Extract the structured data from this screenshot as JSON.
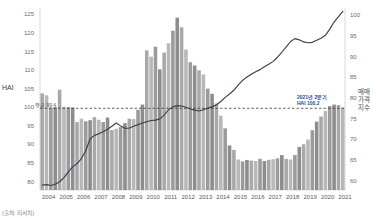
{
  "chart_data": {
    "type": "bar",
    "title": "",
    "subtitle": "",
    "xlabel": "",
    "ylabel": "HAI",
    "ylabel_right": "매매\n가격\n지수",
    "ylim": [
      78,
      127
    ],
    "ylim_right": [
      58,
      102
    ],
    "grid": false,
    "legend_position": "none",
    "reference_line": {
      "value": 100,
      "style": "dashed",
      "label": "평균 99.4"
    },
    "annotations": [
      {
        "text_line1": "평균 99.4",
        "at_x": "2004",
        "at_y": 100
      },
      {
        "text_line1": "2021년 2분기",
        "text_line2": "HAI 100.2",
        "at_x": "2021",
        "at_y": 100.2
      }
    ],
    "categories": [
      "2004",
      "2005",
      "2006",
      "2007",
      "2008",
      "2009",
      "2010",
      "2011",
      "2012",
      "2013",
      "2014",
      "2015",
      "2016",
      "2017",
      "2018",
      "2019",
      "2020",
      "2021"
    ],
    "x_tick_labels": [
      "2004",
      "2005",
      "2006",
      "2007",
      "2008",
      "2009",
      "2010",
      "2011",
      "2012",
      "2013",
      "2014",
      "2015",
      "2016",
      "2017",
      "2018",
      "2019",
      "2020",
      "2021"
    ],
    "y_tick_labels": [
      "125",
      "120",
      "115",
      "110",
      "105",
      "100",
      "95",
      "90",
      "85",
      "80"
    ],
    "y_tick_values": [
      125,
      120,
      115,
      110,
      105,
      100,
      95,
      90,
      85,
      80
    ],
    "y_tick_labels_right": [
      "100",
      "95",
      "90",
      "85",
      "80",
      "75",
      "70",
      "65",
      "60"
    ],
    "y_tick_values_right": [
      100,
      95,
      90,
      85,
      80,
      75,
      70,
      65,
      60
    ],
    "series": [
      {
        "name": "HAI",
        "type": "bar",
        "axis": "left",
        "color": "#9a9a9a",
        "quarterly_values": [
          104.0,
          103.5,
          100.2,
          100.3,
          105.0,
          100.4,
          100.3,
          100.2,
          96.3,
          97.2,
          96.5,
          96.8,
          97.6,
          96.9,
          96.3,
          97.5,
          94.1,
          94.5,
          94.9,
          96.0,
          97.2,
          97.1,
          99.6,
          101.0,
          115.6,
          113.9,
          116.6,
          110.5,
          115.0,
          117.5,
          120.9,
          124.4,
          121.8,
          115.8,
          112.4,
          111.5,
          110.2,
          109.1,
          105.3,
          103.9,
          101.3,
          98.0,
          94.6,
          90.0,
          88.8,
          86.2,
          85.7,
          86.1,
          85.9,
          85.8,
          86.4,
          85.8,
          86.1,
          86.3,
          86.5,
          87.4,
          86.4,
          86.2,
          87.4,
          89.6,
          90.3,
          91.6,
          94.1,
          96.4,
          97.8,
          99.3,
          100.6,
          101.0,
          100.9,
          100.2
        ]
      },
      {
        "name": "매매가격지수",
        "type": "line",
        "axis": "right",
        "color": "#3a3f50",
        "quarterly_values": [
          59.2,
          59.3,
          59.1,
          59.4,
          60.0,
          61.0,
          62.4,
          63.6,
          64.4,
          65.6,
          67.5,
          70.4,
          71.2,
          71.6,
          72.1,
          72.7,
          73.4,
          74.2,
          73.5,
          72.9,
          73.0,
          73.4,
          73.8,
          74.2,
          74.5,
          74.8,
          74.9,
          75.2,
          76.1,
          77.4,
          78.1,
          78.4,
          78.3,
          78.0,
          77.6,
          77.3,
          77.1,
          77.4,
          77.8,
          78.1,
          78.6,
          79.4,
          80.4,
          81.2,
          82.1,
          83.4,
          84.5,
          85.3,
          86.0,
          86.6,
          87.1,
          87.8,
          88.4,
          89.1,
          90.1,
          91.3,
          92.6,
          93.9,
          94.6,
          94.3,
          93.8,
          93.6,
          93.7,
          94.2,
          94.7,
          95.4,
          96.9,
          98.6,
          99.9,
          101.2
        ]
      }
    ]
  },
  "axes": {
    "left_title": "HAI",
    "right_title_lines": [
      "매매",
      "가격",
      "지수"
    ]
  },
  "source_note": "(출처: 리서치)"
}
